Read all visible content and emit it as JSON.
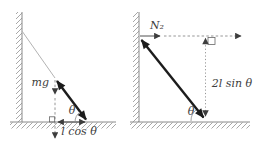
{
  "figure": {
    "description_hidden": "",
    "left_diagram": {
      "weight_label": "mg",
      "angle_label": "θ",
      "base_distance_label": "l cos θ"
    },
    "right_diagram": {
      "normal_force_label": "N₂",
      "angle_label": "θ",
      "height_distance_label": "2l sin θ"
    }
  },
  "colors": {
    "background": "#ffffff",
    "thick_vector": "#1c1c1c",
    "thin_line": "#b3b3b3",
    "dashed_line": "#8a8a8a",
    "surface_line": "#8a8a8a",
    "hatch": "#9e9e9e",
    "text": "#3d3d3d"
  }
}
